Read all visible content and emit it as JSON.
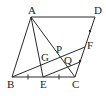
{
  "diagram": {
    "type": "geometry-parallelogram",
    "points": {
      "A": {
        "label": "A",
        "x": 31,
        "y": 17
      },
      "D": {
        "label": "D",
        "x": 95,
        "y": 17
      },
      "B": {
        "label": "B",
        "x": 12,
        "y": 77
      },
      "C": {
        "label": "C",
        "x": 75,
        "y": 77
      },
      "E": {
        "label": "E",
        "x": 43,
        "y": 77
      },
      "F": {
        "label": "F",
        "x": 85,
        "y": 47
      },
      "G": {
        "label": "G",
        "x": 40,
        "y": 59
      },
      "P": {
        "label": "P",
        "x": 59,
        "y": 52
      },
      "Q": {
        "label": "Q",
        "x": 65,
        "y": 63
      }
    },
    "segments": [
      [
        "A",
        "D"
      ],
      [
        "A",
        "B"
      ],
      [
        "B",
        "C"
      ],
      [
        "C",
        "D"
      ],
      [
        "A",
        "C"
      ],
      [
        "A",
        "E"
      ],
      [
        "B",
        "F"
      ],
      [
        "E",
        "H"
      ]
    ],
    "helper_point_H": {
      "x": 80,
      "y": 62
    },
    "tick_marks": {
      "BC": [
        "BE",
        "EC"
      ],
      "CD": [
        "DF",
        "FC"
      ]
    },
    "labels": {
      "A": "A",
      "B": "B",
      "C": "C",
      "D": "D",
      "E": "E",
      "F": "F",
      "G": "G",
      "P": "P",
      "Q": "Q"
    }
  }
}
